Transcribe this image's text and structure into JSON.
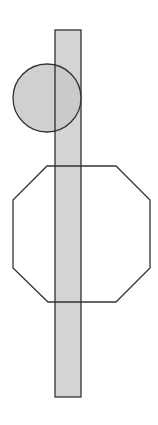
{
  "diagram": {
    "width": 158,
    "height": 425,
    "background": "#ffffff",
    "stroke_color": "#333333",
    "shapes": [
      {
        "id": "tall-rectangle",
        "type": "rect",
        "x": 55,
        "y": 30,
        "width": 26,
        "height": 367,
        "fill": "#d4d4d4",
        "stroke": "#333333",
        "stroke_width": 1.3
      },
      {
        "id": "circle",
        "type": "circle",
        "cx": 47,
        "cy": 98,
        "r": 34,
        "fill": "#c8c8c8",
        "fill_opacity": 0.85,
        "stroke": "#333333",
        "stroke_width": 1.3
      },
      {
        "id": "octagon",
        "type": "polygon",
        "points": "47,166 116,166 150,200 150,268 116,302 48,302 13,268 13,200",
        "fill": "none",
        "stroke": "#333333",
        "stroke_width": 1.3
      }
    ]
  }
}
